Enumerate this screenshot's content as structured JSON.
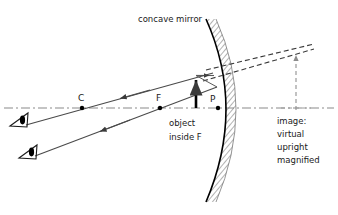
{
  "figure": {
    "title_label": "concave mirror",
    "kind": "ray-diagram"
  },
  "axis": {
    "name": "principal axis",
    "y": 108,
    "x_start": 4,
    "x_end": 334,
    "style": "dash-dot",
    "color": "#8a8a8a"
  },
  "points": [
    {
      "id": "C",
      "label": "C",
      "meaning": "center of curvature",
      "x": 82,
      "y": 108,
      "label_x": 78,
      "label_y": 100
    },
    {
      "id": "F",
      "label": "F",
      "meaning": "focal point",
      "x": 160,
      "y": 108,
      "label_x": 156,
      "label_y": 100
    },
    {
      "id": "P",
      "label": "P",
      "meaning": "pole / vertex",
      "x": 218,
      "y": 108,
      "label_x": 211,
      "label_y": 101
    }
  ],
  "object": {
    "labels": [
      "object",
      "inside  F"
    ],
    "label_x": 170,
    "label_y_first": 125,
    "label_y_second": 139,
    "arrow_x": 196,
    "base_y": 108,
    "tip_y": 75,
    "color": "#000000",
    "description": "upright solid arrow between F and P"
  },
  "image": {
    "labels": [
      "image:",
      "virtual",
      "upright",
      "magnified"
    ],
    "label_x": 277,
    "label_y_start": 121,
    "line_height": 13,
    "arrow_x": 296,
    "base_y": 108,
    "tip_y": 51,
    "style": "dashed",
    "color": "#8c8c8c",
    "description": "virtual upright magnified image behind the mirror"
  },
  "mirror": {
    "label": "concave mirror",
    "label_x": 138,
    "label_y": 22,
    "vertex_x": 218,
    "vertex_y": 108,
    "top_x": 206,
    "top_y": 19,
    "bottom_x": 206,
    "bottom_y": 202,
    "hatch_color": "#6a6a6a",
    "stroke_color": "#000000",
    "description": "arc curving left, hatched backing on the right (convex) side"
  },
  "rays": [
    {
      "name": "parallel-incident-ray",
      "style": "solid",
      "from_x": 196,
      "from_y": 75,
      "to_x": 213,
      "to_y": 75,
      "arrow": true,
      "description": "ray from object tip travelling parallel to the axis toward the mirror"
    },
    {
      "name": "reflected-ray-through-f",
      "style": "solid",
      "from_x": 213,
      "from_y": 75,
      "to_x": 28,
      "to_y": 124,
      "arrow": true,
      "description": "reflected ray appearing to come from F, travelling to the upper eye"
    },
    {
      "name": "incident-ray-to-pole",
      "style": "solid",
      "from_x": 196,
      "from_y": 75,
      "to_x": 216,
      "to_y": 86,
      "arrow": false,
      "description": "second incident ray aimed at the mirror near the pole"
    },
    {
      "name": "reflected-ray-from-pole",
      "style": "solid",
      "from_x": 216,
      "from_y": 86,
      "to_x": 36,
      "to_y": 155,
      "arrow": true,
      "description": "reflected ray travelling to the lower eye"
    }
  ],
  "virtual_extensions": [
    {
      "name": "virtual-ray-extension-upper",
      "style": "dashed",
      "from_x": 206,
      "from_y": 70,
      "to_x": 312,
      "to_y": 45,
      "description": "backward extension of reflected ray locating the image tip"
    },
    {
      "name": "virtual-ray-extension-lower",
      "style": "dashed",
      "from_x": 204,
      "from_y": 80,
      "to_x": 312,
      "to_y": 50,
      "description": "backward extension of second reflected ray"
    }
  ],
  "eyes": [
    {
      "name": "observer-eye-upper",
      "x": 20,
      "y": 120,
      "angle": -18
    },
    {
      "name": "observer-eye-lower",
      "x": 29,
      "y": 151,
      "angle": -18
    }
  ],
  "colors": {
    "ink": "#1a1a1a",
    "ray": "#4a4a4a",
    "axis": "#8a8a8a",
    "dashed": "#7d7d7d",
    "background": "#ffffff"
  }
}
